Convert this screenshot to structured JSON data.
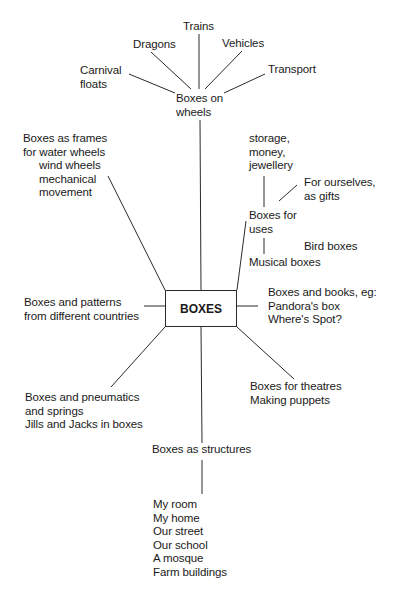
{
  "diagram": {
    "type": "mind-map",
    "center": {
      "label": "BOXES"
    },
    "branches": {
      "wheels": {
        "label": [
          "Boxes on",
          "wheels"
        ],
        "children": {
          "trains": [
            "Trains"
          ],
          "dragons": [
            "Dragons"
          ],
          "vehicles": [
            "Vehicles"
          ],
          "carnival": [
            "Carnival",
            "floats"
          ],
          "transport": [
            "Transport"
          ]
        }
      },
      "frames": {
        "label": [
          "Boxes as frames",
          "for water wheels",
          "wind wheels",
          "mechanical",
          "movement"
        ]
      },
      "uses": {
        "label": [
          "Boxes for",
          "uses"
        ],
        "children": {
          "storage": [
            "storage,",
            "money,",
            "jewellery"
          ],
          "ourselves": [
            "For ourselves,",
            "as gifts"
          ],
          "bird": [
            "Bird boxes"
          ],
          "musical": [
            "Musical boxes"
          ]
        }
      },
      "patterns": {
        "label": [
          "Boxes and patterns",
          "from different countries"
        ]
      },
      "books": {
        "label": [
          "Boxes and books, eg:",
          "Pandora's box",
          "Where's Spot?"
        ]
      },
      "pneumatics": {
        "label": [
          "Boxes and pneumatics",
          "and springs",
          "Jills and Jacks in boxes"
        ]
      },
      "theatres": {
        "label": [
          "Boxes for theatres",
          "Making puppets"
        ]
      },
      "structures": {
        "label": [
          "Boxes as structures"
        ],
        "children": {
          "places": [
            "My room",
            "My home",
            "Our street",
            "Our school",
            "A mosque",
            "Farm buildings"
          ]
        }
      }
    }
  }
}
